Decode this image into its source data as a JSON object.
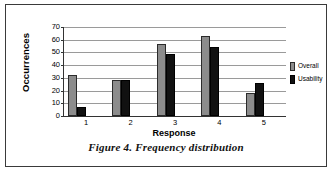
{
  "figure": {
    "caption": "Figure 4. Frequency distribution"
  },
  "legend": {
    "position": "right",
    "entries": [
      {
        "label": "Overall",
        "color": "#8c8c8c"
      },
      {
        "label": "Usability",
        "color": "#111111"
      }
    ]
  },
  "axes": {
    "y_title": "Occurrences",
    "x_title": "Response"
  },
  "chart_data": {
    "type": "bar",
    "title": "",
    "subtitle": "",
    "xlabel": "Response",
    "ylabel": "Occurrences",
    "categories": [
      "1",
      "2",
      "3",
      "4",
      "5"
    ],
    "series": [
      {
        "name": "Overall",
        "color": "#8c8c8c",
        "values": [
          32,
          28,
          57,
          63,
          18
        ]
      },
      {
        "name": "Usability",
        "color": "#111111",
        "values": [
          7,
          28,
          49,
          54,
          26
        ]
      }
    ],
    "ylim": [
      0,
      70
    ],
    "ytick_values": [
      0,
      10,
      20,
      30,
      40,
      50,
      60,
      70
    ],
    "ytick_labels": [
      "0",
      "10",
      "20",
      "30",
      "40",
      "50",
      "60",
      "70"
    ],
    "xtick_labels": [
      "1",
      "2",
      "3",
      "4",
      "5"
    ],
    "grid": true,
    "grid_axis": "y",
    "legend": true,
    "legend_position": "right",
    "annotations": []
  }
}
